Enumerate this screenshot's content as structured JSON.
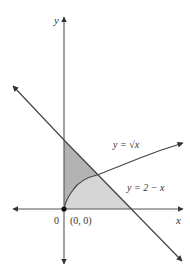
{
  "figure": {
    "axes": {
      "x_label": "x",
      "y_label": "y",
      "origin_label": "0",
      "origin_point_label": "(0, 0)"
    },
    "curves": [
      {
        "name": "sqrt",
        "label": "y = √x",
        "equation": "y = sqrt(x)"
      },
      {
        "name": "line",
        "label": "y = 2 − x",
        "equation": "y = 2 - x"
      }
    ],
    "regions": [
      {
        "name": "upper-region",
        "description": "between y-axis, y = sqrt(x) and y = 2 - x",
        "color": "#b3b3b3"
      },
      {
        "name": "lower-region",
        "description": "between x-axis, y = sqrt(x) and y = 2 - x",
        "color": "#d6d6d6"
      }
    ],
    "key_points": [
      {
        "label": "(0, 0)",
        "x": 0,
        "y": 0
      }
    ],
    "colors": {
      "axis": "#555555",
      "curve": "#444444",
      "point": "#111111"
    }
  }
}
